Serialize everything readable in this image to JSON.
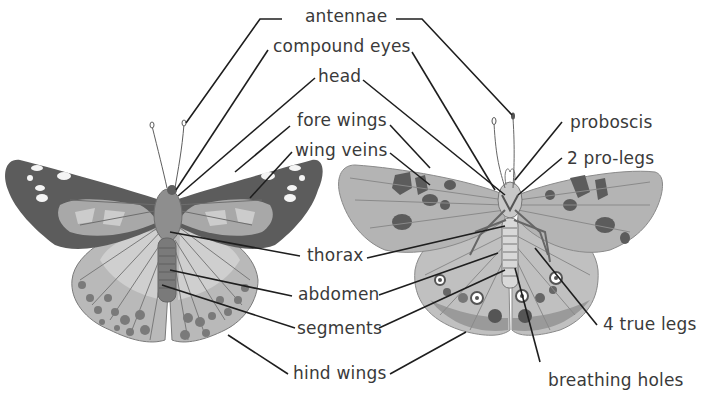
{
  "diagram": {
    "views": [
      {
        "id": "dorsal",
        "description": "upper side of butterfly (left)"
      },
      {
        "id": "ventral",
        "description": "under side of butterfly (right)"
      }
    ],
    "labels": {
      "antennae": "antennae",
      "compound_eyes": "compound eyes",
      "head": "head",
      "fore_wings": "fore wings",
      "wing_veins": "wing veins",
      "thorax": "thorax",
      "abdomen": "abdomen",
      "segments": "segments",
      "hind_wings": "hind wings",
      "proboscis": "proboscis",
      "pro_legs": "2 pro-legs",
      "true_legs": "4 true legs",
      "breathing_holes": "breathing holes"
    },
    "colors": {
      "dark_wing": "#5a5a5a",
      "mid_wing": "#8c8c8c",
      "light_wing": "#b4b4b4",
      "pale_wing": "#d2d2d2",
      "body": "#8a8a8a",
      "leader_line": "#1e1e1e",
      "label_text": "#3a3a3a"
    }
  }
}
